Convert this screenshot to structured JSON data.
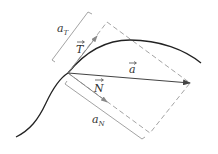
{
  "diagram": {
    "labels": {
      "a_T": {
        "main": "a",
        "sub": "T"
      },
      "a_N": {
        "main": "a",
        "sub": "N"
      },
      "T": "T",
      "N": "N",
      "a": "a"
    },
    "colors": {
      "curve": "#222222",
      "vector_a": "#444444",
      "unit_vectors": "#888888",
      "dashed": "#999999",
      "brackets": "#999999"
    }
  }
}
